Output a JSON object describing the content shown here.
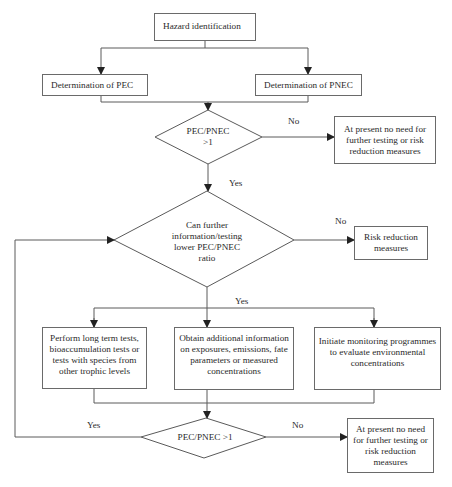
{
  "diagram": {
    "nodes": {
      "hazard": {
        "type": "process",
        "label": "Hazard identification"
      },
      "pec": {
        "type": "process",
        "label": "Determination of PEC"
      },
      "pnec": {
        "type": "process",
        "label": "Determination of PNEC"
      },
      "decision1": {
        "type": "decision",
        "line1": "PEC/PNEC",
        "line2": ">1"
      },
      "no_need1": {
        "type": "terminal",
        "label": "At present no need for further testing or risk reduction measures"
      },
      "decision2": {
        "type": "decision",
        "line1": "Can further",
        "line2": "information/testing",
        "line3": "lower PEC/PNEC",
        "line4": "ratio"
      },
      "risk_reduction": {
        "type": "terminal",
        "label": "Risk reduction measures"
      },
      "long_term_tests": {
        "type": "process",
        "label": "Perform long term tests, bioaccumulation tests or tests with species from other trophic levels"
      },
      "additional_info": {
        "type": "process",
        "label": "Obtain additional information on exposures, emissions, fate parameters or measured concentrations"
      },
      "monitoring": {
        "type": "process",
        "label": "Initiate monitoring programmes to evaluate environmental concentrations"
      },
      "decision3": {
        "type": "decision",
        "label": "PEC/PNEC >1"
      },
      "no_need2": {
        "type": "terminal",
        "label": "At present no need for further testing or risk reduction measures"
      }
    },
    "edge_labels": {
      "d1_no": "No",
      "d1_yes": "Yes",
      "d2_no": "No",
      "d2_yes": "Yes",
      "d3_yes": "Yes",
      "d3_no": "No"
    },
    "edges": [
      {
        "from": "hazard",
        "to": "pec"
      },
      {
        "from": "hazard",
        "to": "pnec"
      },
      {
        "from": "pec",
        "to": "decision1"
      },
      {
        "from": "pnec",
        "to": "decision1"
      },
      {
        "from": "decision1",
        "to": "no_need1",
        "label": "No"
      },
      {
        "from": "decision1",
        "to": "decision2",
        "label": "Yes"
      },
      {
        "from": "decision2",
        "to": "risk_reduction",
        "label": "No"
      },
      {
        "from": "decision2",
        "to": "long_term_tests",
        "label": "Yes"
      },
      {
        "from": "decision2",
        "to": "additional_info",
        "label": "Yes"
      },
      {
        "from": "decision2",
        "to": "monitoring",
        "label": "Yes"
      },
      {
        "from": "long_term_tests",
        "to": "decision3"
      },
      {
        "from": "additional_info",
        "to": "decision3"
      },
      {
        "from": "monitoring",
        "to": "decision3"
      },
      {
        "from": "decision3",
        "to": "decision2",
        "label": "Yes"
      },
      {
        "from": "decision3",
        "to": "no_need2",
        "label": "No"
      }
    ],
    "colors": {
      "line": "#5a5a5a",
      "text": "#2a2a2a",
      "background": "#ffffff"
    }
  }
}
